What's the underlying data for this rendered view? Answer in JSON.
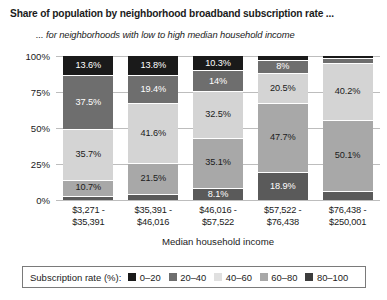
{
  "chart_data": {
    "type": "bar",
    "subtype": "stacked-100-percent",
    "title": "Share of population by neighborhood broadband subscription rate ...",
    "subtitle": "... for neighborhoods with low to high median household income",
    "xlabel": "Median household income",
    "ylabel": "",
    "ylim": [
      0,
      100
    ],
    "ytick_labels": [
      "0%",
      "25%",
      "50%",
      "75%",
      "100%"
    ],
    "ytick_values": [
      0,
      25,
      50,
      75,
      100
    ],
    "grid": true,
    "legend_title": "Subscription rate (%):",
    "legend_position": "bottom",
    "categories": [
      "$3,271 - $35,391",
      "$35,391 - $46,016",
      "$46,016 - $57,522",
      "$57,522 - $76,438",
      "$76,438 - $250,001"
    ],
    "category_lines": [
      [
        "$3,271 -",
        "$35,391"
      ],
      [
        "$35,391 -",
        "$46,016"
      ],
      [
        "$46,016 -",
        "$57,522"
      ],
      [
        "$57,522 -",
        "$76,438"
      ],
      [
        "$76,438 -",
        "$250,001"
      ]
    ],
    "series": [
      {
        "name": "80-100",
        "color": "#1a1a1a",
        "label_color": "#ffffff",
        "values": [
          13.6,
          13.8,
          10.3,
          2.9,
          1.5
        ],
        "labels": [
          "13.6%",
          "13.8%",
          "10.3%",
          "",
          ""
        ]
      },
      {
        "name": "60-80",
        "color": "#6e6e6e",
        "label_color": "#ffffff",
        "values": [
          37.5,
          19.4,
          14.0,
          8.0,
          2.6
        ],
        "labels": [
          "37.5%",
          "19.4%",
          "14%",
          "8%",
          ""
        ]
      },
      {
        "name": "40-60",
        "color": "#d4d4d4",
        "label_color": "#1b1b1b",
        "values": [
          35.7,
          41.6,
          32.5,
          20.5,
          40.2
        ],
        "labels": [
          "35.7%",
          "41.6%",
          "32.5%",
          "20.5%",
          "40.2%"
        ]
      },
      {
        "name": "20-40",
        "color": "#a8a8a8",
        "label_color": "#1b1b1b",
        "values": [
          10.7,
          21.5,
          35.1,
          47.7,
          50.1
        ],
        "labels": [
          "10.7%",
          "21.5%",
          "35.1%",
          "47.7%",
          "50.1%"
        ]
      },
      {
        "name": "0-20",
        "color": "#5a5a5a",
        "label_color": "#ffffff",
        "values": [
          2.5,
          3.7,
          8.1,
          18.9,
          5.6
        ],
        "labels": [
          "",
          "",
          "8.1%",
          "18.9%",
          ""
        ]
      }
    ],
    "legend_entries": [
      {
        "label": "0–20",
        "color": "#1a1a1a"
      },
      {
        "label": "20–40",
        "color": "#6e6e6e"
      },
      {
        "label": "40–60",
        "color": "#e0e0e0"
      },
      {
        "label": "60–80",
        "color": "#a8a8a8"
      },
      {
        "label": "80–100",
        "color": "#3d3d3d"
      }
    ]
  }
}
